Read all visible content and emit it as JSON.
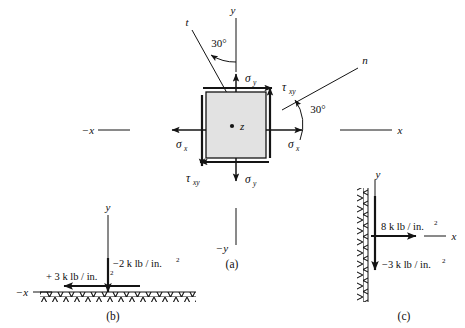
{
  "figure": {
    "title_parts": [
      "(a)",
      "(b)",
      "(c)"
    ],
    "background_color": "#ffffff",
    "line_color": "#141414",
    "element_fill_color": "#e2e2e2"
  },
  "panel_a": {
    "caption": "(a)",
    "axes": {
      "y_positive": "y",
      "y_negative": "−y",
      "x_positive": "x",
      "x_negative": "−x",
      "z_out_of_plane": "z",
      "rotated_normal": "n",
      "rotated_tangent": "t"
    },
    "angles": [
      {
        "name": "angle-t-from-y",
        "value": "30°"
      },
      {
        "name": "angle-n-from-x",
        "value": "30°"
      }
    ],
    "stresses": [
      {
        "name": "sigma-y-top",
        "symbol": "σ",
        "subscript": "y"
      },
      {
        "name": "sigma-y-bottom",
        "symbol": "σ",
        "subscript": "y"
      },
      {
        "name": "sigma-x-left",
        "symbol": "σ",
        "subscript": "x"
      },
      {
        "name": "sigma-x-right",
        "symbol": "σ",
        "subscript": "x"
      },
      {
        "name": "tau-xy-top",
        "symbol": "τ",
        "subscript": "xy"
      },
      {
        "name": "tau-xy-bottom",
        "symbol": "τ",
        "subscript": "xy"
      }
    ],
    "center_point_label": "z"
  },
  "panel_b": {
    "caption": "(b)",
    "axes": {
      "y_positive": "y",
      "x_negative": "−x"
    },
    "forces": [
      {
        "name": "shear-stress-horizontal",
        "text": "+ 3 k lb / in.",
        "superscript": "2",
        "direction": "left"
      },
      {
        "name": "normal-stress-vertical",
        "text": "−2 k lb / in.",
        "superscript": "2",
        "direction": "down"
      }
    ],
    "surface": "hatched-ground-horizontal"
  },
  "panel_c": {
    "caption": "(c)",
    "axes": {
      "y_positive": "y",
      "x_positive": "x"
    },
    "forces": [
      {
        "name": "normal-stress-horizontal",
        "text": "8 k lb / in.",
        "superscript": "2",
        "direction": "right"
      },
      {
        "name": "shear-stress-vertical",
        "text": "−3 k lb / in.",
        "superscript": "2",
        "direction": "down"
      }
    ],
    "surface": "hatched-wall-vertical"
  }
}
